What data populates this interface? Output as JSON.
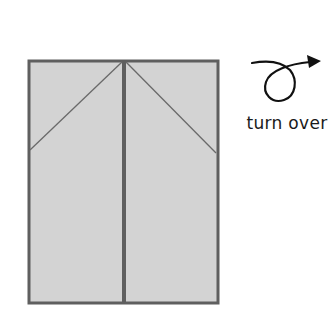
{
  "diagram": {
    "type": "origami-step",
    "paper": {
      "fill": "#d3d3d3",
      "edge_color": "#5f5f5f",
      "fold_line_color": "#6a6a6a",
      "rect": {
        "x": 29,
        "y": 61,
        "width": 189,
        "height": 242
      }
    },
    "center_crease": {
      "x": 123
    },
    "diagonal_folds": [
      {
        "from": [
          123,
          62
        ],
        "to": [
          30,
          150
        ]
      },
      {
        "from": [
          125,
          62
        ],
        "to": [
          216,
          153
        ]
      }
    ],
    "instruction": {
      "icon": "turn-over-icon",
      "label": "turn over"
    }
  }
}
